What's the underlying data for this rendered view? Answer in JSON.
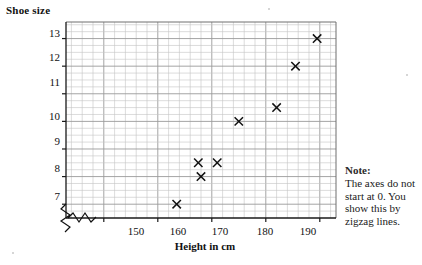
{
  "chart_data": {
    "type": "scatter",
    "title": "Shoe size",
    "xlabel": "Height in cm",
    "ylabel": "Shoe size",
    "xlim": [
      143,
      193
    ],
    "ylim": [
      6.5,
      13.6
    ],
    "xticks": [
      150,
      160,
      170,
      180,
      190
    ],
    "yticks": [
      7,
      8,
      9,
      10,
      11,
      12,
      13
    ],
    "grid": true,
    "legend": null,
    "marker": "cross",
    "points": [
      {
        "x": 163.5,
        "y": 7.0
      },
      {
        "x": 168.0,
        "y": 8.0
      },
      {
        "x": 167.5,
        "y": 8.5
      },
      {
        "x": 171.0,
        "y": 8.5
      },
      {
        "x": 175.0,
        "y": 10.0
      },
      {
        "x": 182.0,
        "y": 10.5
      },
      {
        "x": 185.5,
        "y": 12.0
      },
      {
        "x": 189.5,
        "y": 13.0
      }
    ],
    "annotations": [
      {
        "name": "zigzag-break",
        "text": "",
        "x_axis_break": true
      }
    ]
  },
  "note": {
    "heading": "Note:",
    "body": "The axes do not start at 0. You show this by zigzag lines."
  },
  "ytick_labels": [
    "13",
    "12",
    "11",
    "10",
    "9",
    "8",
    "7"
  ],
  "xtick_labels": [
    "150",
    "160",
    "170",
    "180",
    "190"
  ],
  "axis_titles": {
    "y": "Shoe size",
    "x": "Height in cm"
  }
}
